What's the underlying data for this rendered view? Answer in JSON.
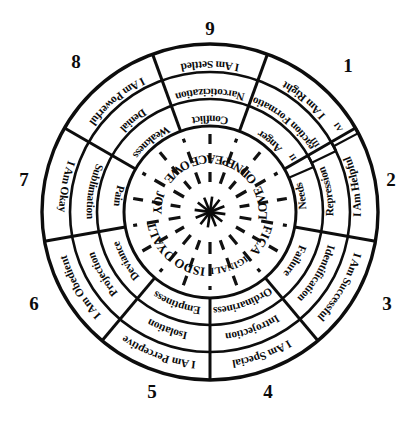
{
  "diagram": {
    "center_icon": "starburst-icon",
    "geometry": {
      "cx": 210,
      "cy": 212,
      "r_outer": 168,
      "r_mid": 140,
      "r_in": 113,
      "r_core": 86,
      "r_core_inner": 0
    },
    "colors": {
      "ink": "#0d0d0d",
      "paper": "#ffffff"
    },
    "ring_markers": [
      {
        "label": "II",
        "name": "ring-marker-ii"
      },
      {
        "label": "III",
        "name": "ring-marker-iii"
      },
      {
        "label": "IV",
        "name": "ring-marker-iv"
      }
    ],
    "points": [
      {
        "number": "1",
        "angle": -50,
        "num_x": 348,
        "num_y": 72,
        "core": "GOODNESS",
        "inner": "Anger",
        "middle": "Reaction Formation",
        "outer": "I Am Right"
      },
      {
        "number": "2",
        "angle": -10,
        "num_x": 391,
        "num_y": 186,
        "core": "LOVE",
        "inner": "Needs",
        "middle": "Repression",
        "outer": "I Am Helpful"
      },
      {
        "number": "3",
        "angle": 30,
        "num_x": 387,
        "num_y": 310,
        "core": "EFFICACY",
        "inner": "Failure",
        "middle": "Identification",
        "outer": "I Am Successful"
      },
      {
        "number": "4",
        "angle": 70,
        "num_x": 268,
        "num_y": 398,
        "core": "ORIGINALITY",
        "inner": "Ordinariness",
        "middle": "Introjection",
        "outer": "I Am Special"
      },
      {
        "number": "5",
        "angle": 110,
        "num_x": 152,
        "num_y": 398,
        "core": "WISDOM",
        "inner": "Emptiness",
        "middle": "Isolation",
        "outer": "I Am Perceptive"
      },
      {
        "number": "6",
        "angle": 150,
        "num_x": 34,
        "num_y": 310,
        "core": "LOYALTY",
        "inner": "Deviance",
        "middle": "Projection",
        "outer": "I Am Obedient"
      },
      {
        "number": "7",
        "angle": 190,
        "num_x": 24,
        "num_y": 186,
        "core": "JOY",
        "inner": "Pain",
        "middle": "Sublimation",
        "outer": "I Am Okay"
      },
      {
        "number": "8",
        "angle": 230,
        "num_x": 76,
        "num_y": 68,
        "core": "POWER",
        "inner": "Weakness",
        "middle": "Denial",
        "outer": "I Am Powerful"
      },
      {
        "number": "9",
        "angle": 270,
        "num_x": 210,
        "num_y": 35,
        "core": "PEACE",
        "inner": "Conflict",
        "middle": "Narcoticization",
        "outer": "I Am Settled"
      }
    ]
  }
}
